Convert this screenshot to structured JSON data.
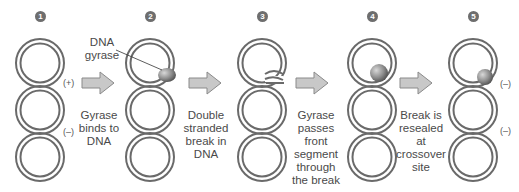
{
  "colors": {
    "strand": "#6a6a6a",
    "arrow_fill": "#c8c8c8",
    "arrow_stroke": "#8a8a8a",
    "enzyme": "#8c8c8c",
    "text": "#4a4a4a"
  },
  "steps": [
    {
      "number": "1",
      "caption": [
        "Gyrase",
        "binds to",
        "DNA"
      ],
      "signs": [
        "(+)",
        "(–)"
      ]
    },
    {
      "number": "2",
      "label": [
        "DNA",
        "gyrase"
      ],
      "caption": [
        "Double",
        "stranded",
        "break in",
        "DNA"
      ]
    },
    {
      "number": "3",
      "caption": [
        "Gyrase",
        "passes",
        "front",
        "segment",
        "through",
        "the break"
      ]
    },
    {
      "number": "4",
      "caption": [
        "Break is",
        "resealed at",
        "crossover",
        "site"
      ]
    },
    {
      "number": "5",
      "signs": [
        "(–)",
        "(–)"
      ]
    }
  ]
}
